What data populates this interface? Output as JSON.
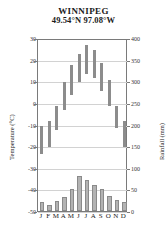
{
  "chart_data": {
    "type": "bar",
    "title": "WINNIPEG",
    "subtitle": "49.54°N 97.08°W",
    "categories": [
      "J",
      "F",
      "M",
      "A",
      "M",
      "J",
      "J",
      "A",
      "S",
      "O",
      "N",
      "D"
    ],
    "month_names": [
      "January",
      "February",
      "March",
      "April",
      "May",
      "June",
      "July",
      "August",
      "September",
      "October",
      "November",
      "December"
    ],
    "ylabel": "Temperature (°C)",
    "ylabel_right": "Rainfall (mm)",
    "xlabel": "",
    "ylim": [
      -50,
      30
    ],
    "ylim_right": [
      0,
      400
    ],
    "yticks": [
      30,
      20,
      10,
      0,
      -10,
      -20,
      -30,
      -40,
      -50
    ],
    "yticks_right": [
      400,
      350,
      300,
      250,
      200,
      150,
      100,
      50,
      0
    ],
    "grid": true,
    "legend": "none",
    "series": [
      {
        "name": "Temperature range",
        "type": "range-bar",
        "axis": "left",
        "unit": "°C",
        "color": "#8c8c8c",
        "low": [
          -23,
          -20,
          -12,
          -3,
          4,
          10,
          14,
          12,
          6,
          -1,
          -11,
          -20
        ],
        "high": [
          -10,
          -8,
          -1,
          10,
          18,
          23,
          27,
          25,
          19,
          11,
          -1,
          -8
        ]
      },
      {
        "name": "Rainfall",
        "type": "bar",
        "axis": "right",
        "unit": "mm",
        "color": "#b3b3b3",
        "values": [
          20,
          15,
          23,
          32,
          50,
          80,
          72,
          60,
          50,
          35,
          25,
          20
        ]
      }
    ]
  },
  "colors": {
    "temp_bar": "#8c8c8c",
    "rain_bar": "#b3b3b3",
    "rain_bar_border": "#8a8a8a",
    "axis": "#7a7a7a",
    "grid": "#d2d2d2",
    "background": "#ffffff",
    "text": "#1a1a1a"
  }
}
